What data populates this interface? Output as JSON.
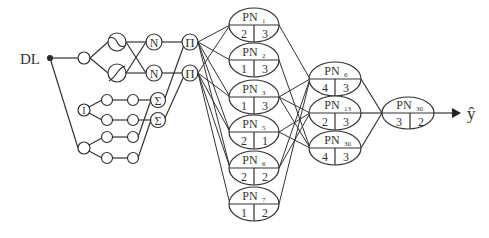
{
  "diagram": {
    "input_label": "DL",
    "output_label": "ŷ",
    "layer1": {
      "membership_top": [
        "~",
        "~"
      ],
      "normalize": [
        "N",
        "N"
      ],
      "product": [
        "Π",
        "Π"
      ],
      "integrator": "I",
      "sum": [
        "Σ",
        "Σ"
      ]
    },
    "pn_layer1": [
      {
        "name": "PN",
        "sub": "1",
        "left": "2",
        "right": "3"
      },
      {
        "name": "PN",
        "sub": "2",
        "left": "1",
        "right": "3"
      },
      {
        "name": "PN",
        "sub": "3",
        "left": "1",
        "right": "3"
      },
      {
        "name": "PN",
        "sub": "5",
        "left": "2",
        "right": "1"
      },
      {
        "name": "PN",
        "sub": "6",
        "left": "2",
        "right": "2"
      },
      {
        "name": "PN",
        "sub": "7",
        "left": "1",
        "right": "2"
      }
    ],
    "pn_layer2": [
      {
        "name": "PN",
        "sub": "6",
        "left": "4",
        "right": "3"
      },
      {
        "name": "PN",
        "sub": "13",
        "left": "2",
        "right": "3"
      },
      {
        "name": "PN",
        "sub": "30",
        "left": "4",
        "right": "3"
      }
    ],
    "pn_output": {
      "name": "PN",
      "sub": "30",
      "left": "3",
      "right": "2"
    }
  }
}
